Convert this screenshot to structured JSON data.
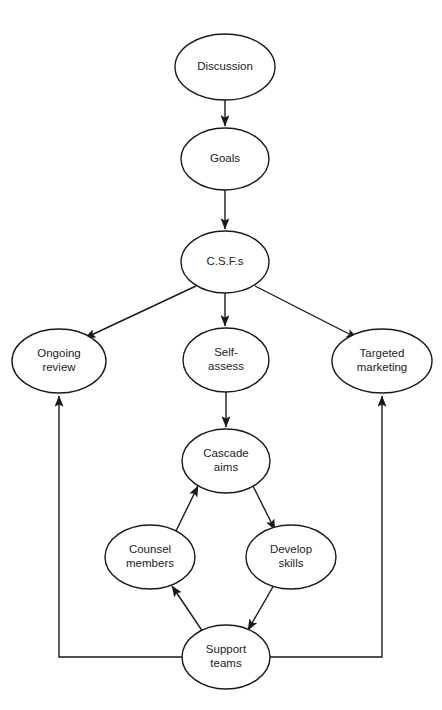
{
  "diagram": {
    "shape": "ellipse",
    "node_fill": "#ffffff",
    "node_stroke": "#1a1a1a",
    "edge_color": "#1a1a1a",
    "text_color": "#222222",
    "background": "#ffffff",
    "nodes": [
      {
        "id": "discussion",
        "label": "Discussion",
        "lines": [
          "Discussion"
        ],
        "cx": 225,
        "cy": 67,
        "rx": 50,
        "ry": 33
      },
      {
        "id": "goals",
        "label": "Goals",
        "lines": [
          "Goals"
        ],
        "cx": 225,
        "cy": 159,
        "rx": 44,
        "ry": 31
      },
      {
        "id": "csfs",
        "label": "C.S.F.s",
        "lines": [
          "C.S.F.s"
        ],
        "cx": 225,
        "cy": 262,
        "rx": 44,
        "ry": 31
      },
      {
        "id": "ongoing-review",
        "label": "Ongoing review",
        "lines": [
          "Ongoing",
          "review"
        ],
        "cx": 59,
        "cy": 361,
        "rx": 47,
        "ry": 32
      },
      {
        "id": "self-assess",
        "label": "Self-assess",
        "lines": [
          "Self-",
          "assess"
        ],
        "cx": 226,
        "cy": 360,
        "rx": 43,
        "ry": 32
      },
      {
        "id": "targeted-marketing",
        "label": "Targeted marketing",
        "lines": [
          "Targeted",
          "marketing"
        ],
        "cx": 382,
        "cy": 361,
        "rx": 50,
        "ry": 32
      },
      {
        "id": "cascade-aims",
        "label": "Cascade aims",
        "lines": [
          "Cascade",
          "aims"
        ],
        "cx": 226,
        "cy": 461,
        "rx": 44,
        "ry": 32
      },
      {
        "id": "counsel-members",
        "label": "Counsel members",
        "lines": [
          "Counsel",
          "members"
        ],
        "cx": 150,
        "cy": 557,
        "rx": 45,
        "ry": 32
      },
      {
        "id": "develop-skills",
        "label": "Develop skills",
        "lines": [
          "Develop",
          "skills"
        ],
        "cx": 291,
        "cy": 557,
        "rx": 45,
        "ry": 32
      },
      {
        "id": "support-teams",
        "label": "Support teams",
        "lines": [
          "Support",
          "teams"
        ],
        "cx": 226,
        "cy": 657,
        "rx": 44,
        "ry": 32
      }
    ],
    "edges": [
      {
        "id": "discussion-to-goals",
        "from": "Discussion",
        "to": "Goals",
        "arrow": true,
        "points": "225,100 225,126"
      },
      {
        "id": "goals-to-csfs",
        "from": "Goals",
        "to": "C.S.F.s",
        "arrow": true,
        "points": "225,190 225,229"
      },
      {
        "id": "csfs-to-ongoing-review",
        "from": "C.S.F.s",
        "to": "Ongoing review",
        "arrow": true,
        "points": "196,286 85,338"
      },
      {
        "id": "csfs-to-self-assess",
        "from": "C.S.F.s",
        "to": "Self-assess",
        "arrow": true,
        "points": "225,293 225,326"
      },
      {
        "id": "csfs-to-targeted-marketing",
        "from": "C.S.F.s",
        "to": "Targeted marketing",
        "arrow": true,
        "points": "255,286 357,338"
      },
      {
        "id": "self-assess-to-cascade-aims",
        "from": "Self-assess",
        "to": "Cascade aims",
        "arrow": true,
        "points": "226,392 226,427"
      },
      {
        "id": "counsel-members-to-cascade-aims",
        "from": "Counsel members",
        "to": "Cascade aims",
        "arrow": true,
        "points": "175,533 198,486"
      },
      {
        "id": "cascade-aims-to-develop-skills",
        "from": "Cascade aims",
        "to": "Develop skills",
        "arrow": true,
        "points": "253,486 275,530"
      },
      {
        "id": "develop-skills-to-support-teams",
        "from": "Develop skills",
        "to": "Support teams",
        "arrow": true,
        "points": "274,585 248,630"
      },
      {
        "id": "support-teams-to-counsel-members",
        "from": "Support teams",
        "to": "Counsel members",
        "arrow": true,
        "points": "203,632 172,586"
      },
      {
        "id": "support-teams-to-ongoing-review",
        "from": "Support teams",
        "to": "Ongoing review",
        "arrow": true,
        "points": "182,657 59,657 59,396"
      },
      {
        "id": "support-teams-to-targeted-marketing",
        "from": "Support teams",
        "to": "Targeted marketing",
        "arrow": true,
        "points": "270,657 382,657 382,396"
      }
    ]
  }
}
